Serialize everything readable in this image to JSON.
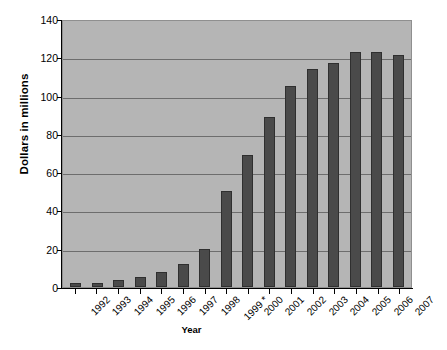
{
  "chart_data": {
    "type": "bar",
    "title": "",
    "xlabel": "Year",
    "ylabel": "Dollars in millions",
    "categories": [
      "1992",
      "1993",
      "1994",
      "1995",
      "1996",
      "1997",
      "1998",
      "1999 *",
      "2000",
      "2001",
      "2002",
      "2003",
      "2004",
      "2005",
      "2006",
      "2007"
    ],
    "values": [
      2,
      2,
      3.5,
      5,
      8,
      12,
      20,
      50,
      69,
      89,
      105,
      114,
      117,
      123,
      123,
      121
    ],
    "ylim": [
      0,
      140
    ],
    "ytick_labels": [
      "0",
      "20",
      "40",
      "60",
      "80",
      "100",
      "120",
      "140"
    ],
    "ytick_values": [
      0,
      20,
      40,
      60,
      80,
      100,
      120,
      140
    ],
    "grid": true,
    "legend": "none",
    "series": [
      {
        "name": "Dollars in millions",
        "values": [
          2,
          2,
          3.5,
          5,
          8,
          12,
          20,
          50,
          69,
          89,
          105,
          114,
          117,
          123,
          123,
          121
        ]
      }
    ],
    "colors": {
      "bar": "#4a4a4a",
      "bar_border": "#2f2f2f",
      "plot_background": "#b5b5b5",
      "gridline": "#6d6d6d",
      "axis": "#000000",
      "page_background": "#ffffff"
    },
    "annotations": [
      "1999 * denotes asterisk on the 1999 category label"
    ]
  }
}
